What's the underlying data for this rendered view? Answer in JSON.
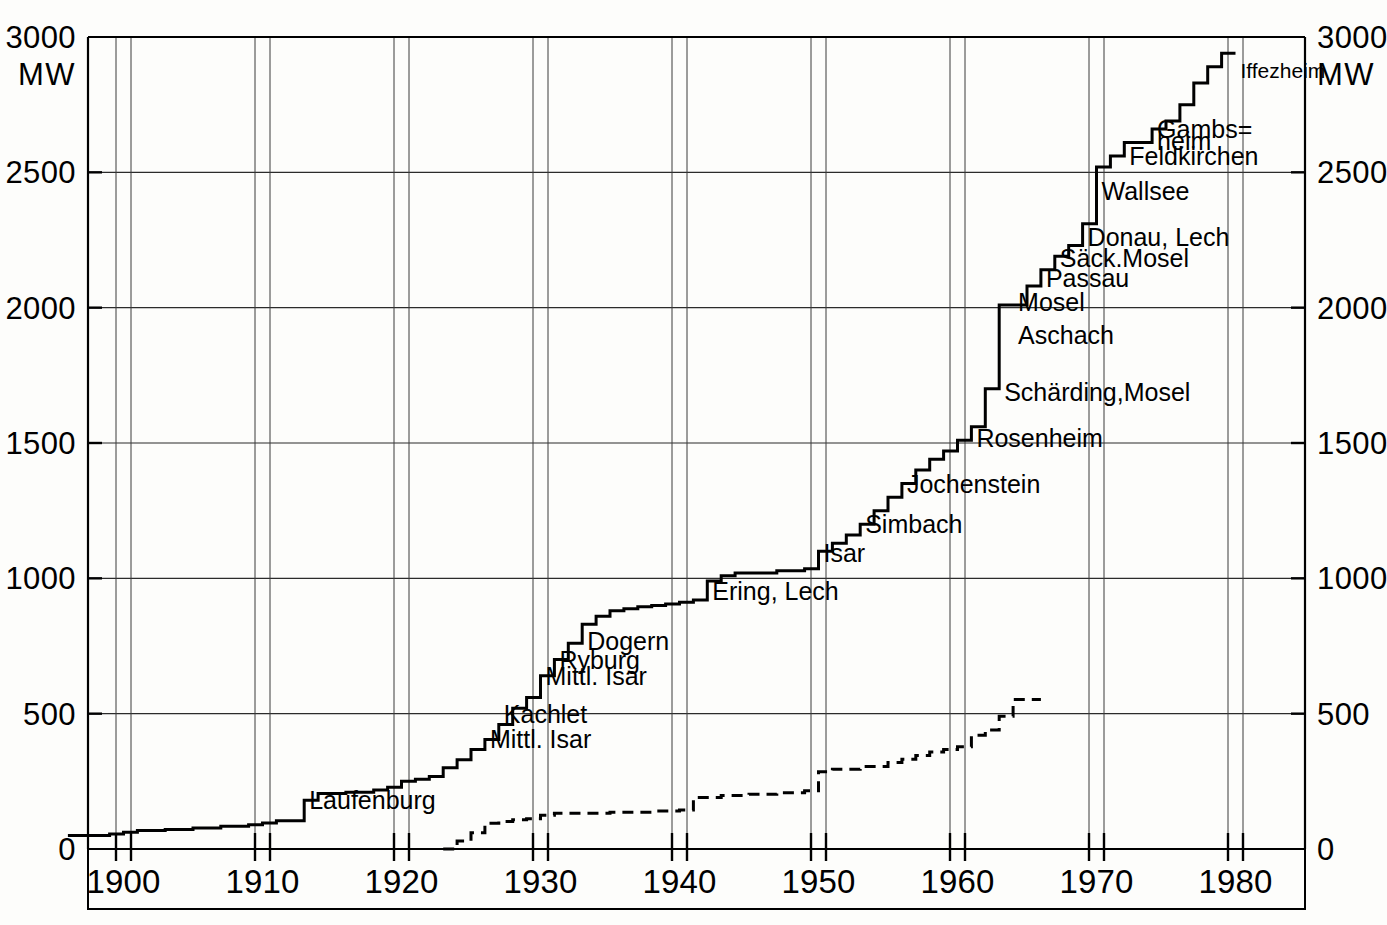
{
  "chart_data": {
    "type": "line",
    "title": "",
    "subtitle": "",
    "xlabel": "",
    "ylabel": "MW",
    "unit": "MW",
    "xlim": [
      1896,
      1984
    ],
    "ylim": [
      0,
      3000
    ],
    "grid": true,
    "legend": "none",
    "y_ticks": [
      0,
      500,
      1000,
      1500,
      2000,
      2500,
      3000
    ],
    "y_tick_labels": [
      "0",
      "500",
      "1000",
      "1500",
      "2000",
      "2500",
      "3000"
    ],
    "y_axis_unit_top_left": "MW",
    "y_axis_unit_top_right": "MW",
    "x_ticks": [
      1900,
      1910,
      1920,
      1930,
      1940,
      1950,
      1960,
      1970,
      1980
    ],
    "x_tick_labels": [
      "1900",
      "1910",
      "1920",
      "1930",
      "1940",
      "1950",
      "1960",
      "1970",
      "1980"
    ],
    "series": [
      {
        "name": "Installierte Leistung (kumuliert)",
        "style": "solid",
        "step": "post",
        "points": [
          [
            1896,
            50
          ],
          [
            1899,
            55
          ],
          [
            1900,
            62
          ],
          [
            1901,
            68
          ],
          [
            1903,
            72
          ],
          [
            1905,
            78
          ],
          [
            1907,
            84
          ],
          [
            1909,
            90
          ],
          [
            1910,
            96
          ],
          [
            1911,
            104
          ],
          [
            1913,
            180
          ],
          [
            1914,
            205
          ],
          [
            1916,
            210
          ],
          [
            1918,
            218
          ],
          [
            1919,
            228
          ],
          [
            1920,
            250
          ],
          [
            1921,
            258
          ],
          [
            1922,
            268
          ],
          [
            1923,
            300
          ],
          [
            1924,
            330
          ],
          [
            1925,
            368
          ],
          [
            1926,
            405
          ],
          [
            1927,
            460
          ],
          [
            1928,
            520
          ],
          [
            1929,
            560
          ],
          [
            1930,
            640
          ],
          [
            1931,
            700
          ],
          [
            1932,
            760
          ],
          [
            1933,
            830
          ],
          [
            1934,
            860
          ],
          [
            1935,
            880
          ],
          [
            1936,
            888
          ],
          [
            1937,
            895
          ],
          [
            1938,
            900
          ],
          [
            1939,
            905
          ],
          [
            1940,
            912
          ],
          [
            1941,
            920
          ],
          [
            1942,
            990
          ],
          [
            1943,
            1010
          ],
          [
            1944,
            1020
          ],
          [
            1947,
            1028
          ],
          [
            1949,
            1035
          ],
          [
            1950,
            1100
          ],
          [
            1951,
            1130
          ],
          [
            1952,
            1160
          ],
          [
            1953,
            1200
          ],
          [
            1954,
            1250
          ],
          [
            1955,
            1300
          ],
          [
            1956,
            1350
          ],
          [
            1957,
            1400
          ],
          [
            1958,
            1440
          ],
          [
            1959,
            1470
          ],
          [
            1960,
            1510
          ],
          [
            1961,
            1560
          ],
          [
            1962,
            1700
          ],
          [
            1963,
            2010
          ],
          [
            1965,
            2080
          ],
          [
            1966,
            2140
          ],
          [
            1967,
            2190
          ],
          [
            1968,
            2230
          ],
          [
            1969,
            2310
          ],
          [
            1970,
            2520
          ],
          [
            1971,
            2560
          ],
          [
            1972,
            2610
          ],
          [
            1974,
            2660
          ],
          [
            1975,
            2690
          ],
          [
            1976,
            2750
          ],
          [
            1977,
            2830
          ],
          [
            1978,
            2890
          ],
          [
            1979,
            2940
          ],
          [
            1980,
            2940
          ]
        ]
      },
      {
        "name": "Zweite Kennlinie (gestrichelt)",
        "style": "dashed",
        "step": "post",
        "points": [
          [
            1923,
            0
          ],
          [
            1924,
            30
          ],
          [
            1925,
            60
          ],
          [
            1926,
            95
          ],
          [
            1927,
            102
          ],
          [
            1928,
            108
          ],
          [
            1929,
            112
          ],
          [
            1930,
            125
          ],
          [
            1931,
            132
          ],
          [
            1935,
            136
          ],
          [
            1938,
            140
          ],
          [
            1940,
            144
          ],
          [
            1941,
            190
          ],
          [
            1943,
            198
          ],
          [
            1945,
            202
          ],
          [
            1947,
            208
          ],
          [
            1949,
            215
          ],
          [
            1950,
            285
          ],
          [
            1951,
            295
          ],
          [
            1953,
            305
          ],
          [
            1955,
            320
          ],
          [
            1956,
            332
          ],
          [
            1957,
            345
          ],
          [
            1958,
            358
          ],
          [
            1959,
            368
          ],
          [
            1960,
            378
          ],
          [
            1961,
            420
          ],
          [
            1962,
            440
          ],
          [
            1963,
            490
          ],
          [
            1964,
            552
          ],
          [
            1966,
            552
          ]
        ]
      }
    ],
    "annotations": [
      {
        "label": "Laufenburg",
        "x": 1913,
        "y": 180,
        "align": "left"
      },
      {
        "label": "Mittl. Isar",
        "x": 1926,
        "y": 405,
        "align": "left"
      },
      {
        "label": "Kachlet",
        "x": 1927,
        "y": 500,
        "align": "left"
      },
      {
        "label": "Mittl. Isar",
        "x": 1930,
        "y": 640,
        "align": "left"
      },
      {
        "label": "Ryburg",
        "x": 1931,
        "y": 700,
        "align": "left"
      },
      {
        "label": "Dogern",
        "x": 1933,
        "y": 770,
        "align": "left"
      },
      {
        "label": "Ering, Lech",
        "x": 1942,
        "y": 955,
        "align": "left"
      },
      {
        "label": "Isar",
        "x": 1950,
        "y": 1095,
        "align": "left"
      },
      {
        "label": "Simbach",
        "x": 1953,
        "y": 1200,
        "align": "left"
      },
      {
        "label": "Jochenstein",
        "x": 1956,
        "y": 1350,
        "align": "left"
      },
      {
        "label": "Rosenheim",
        "x": 1961,
        "y": 1520,
        "align": "left"
      },
      {
        "label": "Schärding,Mosel",
        "x": 1963,
        "y": 1690,
        "align": "left"
      },
      {
        "label": "Aschach",
        "x": 1964,
        "y": 1900,
        "align": "left"
      },
      {
        "label": "Mosel",
        "x": 1964,
        "y": 2020,
        "align": "left"
      },
      {
        "label": "Passau",
        "x": 1966,
        "y": 2110,
        "align": "left"
      },
      {
        "label": "Säck.Mosel",
        "x": 1967,
        "y": 2185,
        "align": "left"
      },
      {
        "label": "Donau, Lech",
        "x": 1969,
        "y": 2260,
        "align": "left"
      },
      {
        "label": "Wallsee",
        "x": 1970,
        "y": 2430,
        "align": "left"
      },
      {
        "label": "Feldkirchen",
        "x": 1972,
        "y": 2560,
        "align": "left"
      },
      {
        "label": "Gambs=",
        "x": 1974,
        "y": 2660,
        "align": "left"
      },
      {
        "label": "heim",
        "x": 1974,
        "y": 2615,
        "align": "left"
      },
      {
        "label": "Iffezheim",
        "x": 1980,
        "y": 2880,
        "align": "left"
      }
    ],
    "year_guides": [
      1900,
      1910,
      1920,
      1930,
      1940,
      1950,
      1960,
      1970,
      1980
    ]
  }
}
